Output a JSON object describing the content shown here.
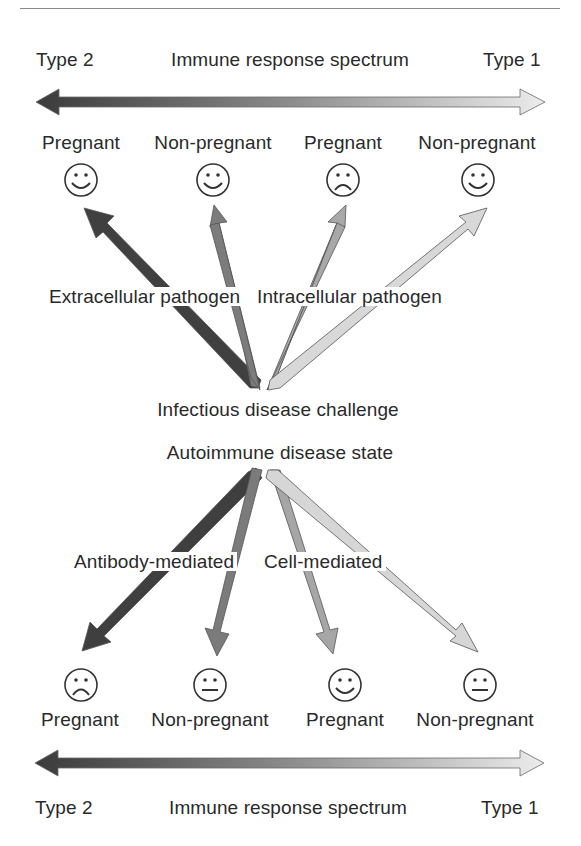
{
  "top_spectrum": {
    "left_label": "Type 2",
    "center_label": "Immune response spectrum",
    "right_label": "Type 1",
    "gradient": {
      "left_color": "#3c3c3c",
      "right_color": "#e6e6e6"
    }
  },
  "top_outcomes": [
    {
      "label": "Pregnant",
      "face": "happy"
    },
    {
      "label": "Non-pregnant",
      "face": "happy"
    },
    {
      "label": "Pregnant",
      "face": "sad"
    },
    {
      "label": "Non-pregnant",
      "face": "happy"
    }
  ],
  "infectious": {
    "left_branch_label": "Extracellular pathogen",
    "right_branch_label": "Intracellular pathogen",
    "source_label": "Infectious disease challenge",
    "arrow_colors": [
      "#3f3f3f",
      "#7a7a7a",
      "#a6a6a6",
      "#d6d6d6"
    ]
  },
  "autoimmune": {
    "source_label": "Autoimmune disease state",
    "left_branch_label": "Antibody-mediated",
    "right_branch_label": "Cell-mediated",
    "arrow_colors": [
      "#3f3f3f",
      "#7a7a7a",
      "#a6a6a6",
      "#d6d6d6"
    ]
  },
  "bottom_outcomes": [
    {
      "label": "Pregnant",
      "face": "sad"
    },
    {
      "label": "Non-pregnant",
      "face": "neutral"
    },
    {
      "label": "Pregnant",
      "face": "happy"
    },
    {
      "label": "Non-pregnant",
      "face": "neutral"
    }
  ],
  "bottom_spectrum": {
    "left_label": "Type 2",
    "center_label": "Immune response spectrum",
    "right_label": "Type 1"
  }
}
